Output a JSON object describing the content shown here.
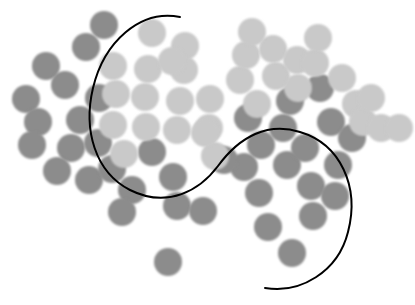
{
  "figure": {
    "title": "",
    "width": 415,
    "height": 305,
    "background_color": "#ffffff"
  },
  "chart_data": {
    "type": "scatter",
    "title": "",
    "subtitle": "",
    "xlabel": "",
    "ylabel": "",
    "xlim": [
      0,
      415
    ],
    "ylim": [
      0,
      305
    ],
    "grid": false,
    "axes_visible": false,
    "tick_labels": [],
    "legend": {
      "visible": false,
      "position": "none",
      "entries": [
        {
          "name": "Class A",
          "color": "#8c8c8c"
        },
        {
          "name": "Class B",
          "color": "#c9c9c9"
        }
      ]
    },
    "marker": {
      "shape": "circle",
      "radius_px": 14,
      "edge": "soft-blur"
    },
    "series": [
      {
        "name": "Class A",
        "color": "#8c8c8c",
        "points": [
          [
            104,
            25
          ],
          [
            86,
            47
          ],
          [
            46,
            66
          ],
          [
            65,
            85
          ],
          [
            26,
            99
          ],
          [
            38,
            122
          ],
          [
            80,
            120
          ],
          [
            99,
            98
          ],
          [
            32,
            145
          ],
          [
            71,
            148
          ],
          [
            98,
            143
          ],
          [
            57,
            171
          ],
          [
            89,
            180
          ],
          [
            112,
            169
          ],
          [
            132,
            190
          ],
          [
            152,
            152
          ],
          [
            173,
            177
          ],
          [
            177,
            206
          ],
          [
            122,
            212
          ],
          [
            203,
            211
          ],
          [
            168,
            262
          ],
          [
            244,
            167
          ],
          [
            259,
            193
          ],
          [
            261,
            145
          ],
          [
            248,
            118
          ],
          [
            283,
            128
          ],
          [
            287,
            165
          ],
          [
            290,
            101
          ],
          [
            305,
            148
          ],
          [
            311,
            186
          ],
          [
            313,
            216
          ],
          [
            268,
            227
          ],
          [
            292,
            253
          ],
          [
            331,
            122
          ],
          [
            338,
            165
          ],
          [
            335,
            196
          ],
          [
            352,
            138
          ],
          [
            320,
            88
          ],
          [
            224,
            160
          ]
        ]
      },
      {
        "name": "Class B",
        "color": "#c9c9c9",
        "points": [
          [
            152,
            33
          ],
          [
            113,
            66
          ],
          [
            185,
            46
          ],
          [
            148,
            69
          ],
          [
            184,
            70
          ],
          [
            116,
            94
          ],
          [
            145,
            97
          ],
          [
            180,
            101
          ],
          [
            210,
            99
          ],
          [
            113,
            125
          ],
          [
            146,
            127
          ],
          [
            177,
            130
          ],
          [
            209,
            128
          ],
          [
            240,
            80
          ],
          [
            246,
            55
          ],
          [
            257,
            104
          ],
          [
            276,
            76
          ],
          [
            273,
            49
          ],
          [
            297,
            60
          ],
          [
            298,
            88
          ],
          [
            315,
            63
          ],
          [
            318,
            38
          ],
          [
            342,
            78
          ],
          [
            356,
            104
          ],
          [
            363,
            122
          ],
          [
            381,
            128
          ],
          [
            399,
            128
          ],
          [
            371,
            98
          ],
          [
            124,
            154
          ],
          [
            172,
            61
          ],
          [
            215,
            156
          ],
          [
            205,
            133
          ],
          [
            252,
            32
          ]
        ]
      }
    ],
    "decision_boundary": {
      "name": "decision boundary",
      "color": "#000000",
      "line_width": 2,
      "path": "M 180 17 C 140 9, 104 42, 93 88 C 83 130, 95 172, 130 190 C 168 209, 200 190, 218 166 C 240 136, 268 122, 300 132 C 340 144, 360 186, 348 232 C 338 272, 300 294, 265 288"
    }
  }
}
